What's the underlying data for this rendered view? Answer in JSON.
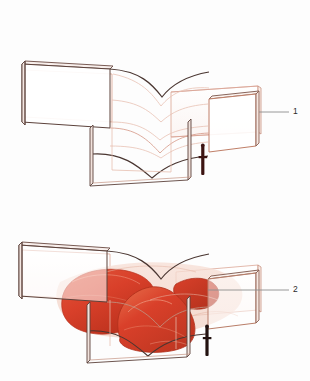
{
  "figure": {
    "background_color": "#fdfdfd",
    "width": 310,
    "height": 381
  },
  "palette": {
    "outline_dark": "#4a3631",
    "outline_light": "#d9a192",
    "outline_faint": "#e8c4b8",
    "red_fill": "#d9402a",
    "red_fill_light": "#e4603f",
    "red_fill_dark": "#b8301c",
    "red_haze": "#f3d3c8",
    "leader_line": "#8d8d8d",
    "label_text": "#2b2b2b",
    "scale_figure": "#3d1412"
  },
  "panels": [
    {
      "id": "panel-top",
      "name": "wireframe-view",
      "description": "Transparent wireframe of an X-shaped (cruciform) structural wall assembly with a waisted central core",
      "callout": {
        "number": "1",
        "label_x": 296,
        "label_y": 112,
        "leader_from_x": 259,
        "leader_from_y": 112,
        "leader_to_x": 289,
        "leader_to_y": 112
      },
      "scale_figure": {
        "name": "human-scale-figure",
        "x": 203,
        "y": 146,
        "height": 29
      }
    },
    {
      "id": "panel-bottom",
      "name": "stress-volume-view",
      "description": "Same cruciform structure overlaid with red solid volumes showing load/stress bodies",
      "callout": {
        "number": "2",
        "label_x": 296,
        "label_y": 290,
        "leader_from_x": 208,
        "leader_from_y": 290,
        "leader_to_x": 289,
        "leader_to_y": 290
      },
      "scale_figure": {
        "name": "human-scale-figure",
        "x": 207,
        "y": 327,
        "height": 29
      },
      "volumes": [
        {
          "name": "left-lobe",
          "color": "#d9402a"
        },
        {
          "name": "center-dome",
          "color": "#d9402a"
        },
        {
          "name": "right-lobe",
          "color": "#d9402a"
        }
      ]
    }
  ]
}
